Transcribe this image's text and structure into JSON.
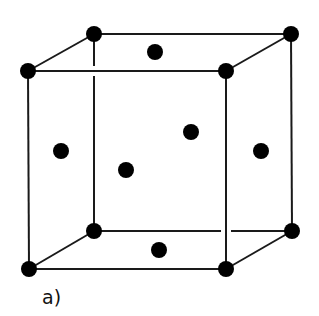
{
  "diagram": {
    "label": "a)",
    "colors": {
      "line": "#1a1a1a",
      "atom": "#000000",
      "background": "#ffffff"
    },
    "corner_atoms": [
      {
        "name": "front-top-left",
        "x": 28,
        "y": 71
      },
      {
        "name": "back-top-left",
        "x": 94,
        "y": 34
      },
      {
        "name": "back-top-right",
        "x": 291,
        "y": 34
      },
      {
        "name": "front-top-right",
        "x": 226,
        "y": 71
      },
      {
        "name": "front-bottom-left",
        "x": 29,
        "y": 269
      },
      {
        "name": "back-bottom-left",
        "x": 94,
        "y": 231
      },
      {
        "name": "back-bottom-right",
        "x": 292,
        "y": 231
      },
      {
        "name": "front-bottom-right",
        "x": 226,
        "y": 269
      }
    ],
    "face_atoms": [
      {
        "name": "top-face",
        "x": 155,
        "y": 52
      },
      {
        "name": "left-face",
        "x": 61,
        "y": 151
      },
      {
        "name": "back-face",
        "x": 191,
        "y": 132
      },
      {
        "name": "front-face",
        "x": 126,
        "y": 170
      },
      {
        "name": "right-face",
        "x": 261,
        "y": 151
      },
      {
        "name": "bottom-face",
        "x": 159,
        "y": 250
      }
    ]
  }
}
